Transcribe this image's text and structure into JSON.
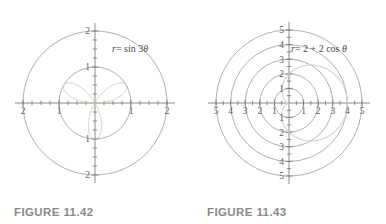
{
  "page": {
    "background_color": "#ffffff",
    "type": "textbook-polar-plot-pair"
  },
  "figures": [
    {
      "caption": "FIGURE 11.42",
      "equation_plain": "r = sin 3θ",
      "equation_parts": {
        "r": "r",
        "eq": "= sin 3",
        "theta": "θ"
      },
      "axis_max": 2,
      "x_labels_left": [
        "2",
        "1"
      ],
      "x_labels_right": [
        "1",
        "2"
      ],
      "y_labels_up": [
        "1",
        "2"
      ],
      "y_labels_down": [
        "1",
        "2"
      ],
      "grid_circle_radii": [
        1,
        2
      ],
      "curve_color": "#cfc6b4",
      "grid_color": "#8d8d8d"
    },
    {
      "caption": "FIGURE 11.43",
      "equation_plain": "r = 2 + 2 cos θ",
      "equation_parts": {
        "r": "r",
        "eq": "= 2 + 2 cos ",
        "theta": "θ"
      },
      "axis_max": 5,
      "x_labels_left": [
        "5",
        "4",
        "3",
        "2",
        "1"
      ],
      "x_labels_right": [
        "1",
        "2",
        "3",
        "4",
        "5"
      ],
      "y_labels_up": [
        "1",
        "2",
        "3",
        "4",
        "5"
      ],
      "y_labels_down": [
        "1",
        "2",
        "3",
        "4",
        "5"
      ],
      "grid_circle_radii": [
        1,
        2,
        3,
        4,
        5
      ],
      "curve_color": "#d6d2c8",
      "grid_color": "#8d8d8d"
    }
  ],
  "chart_data": [
    {
      "type": "line",
      "subtype": "polar",
      "title": "FIGURE 11.42",
      "equation": "r = sin 3θ",
      "xlabel": "",
      "ylabel": "",
      "xlim": [
        -2,
        2
      ],
      "ylim": [
        -2,
        2
      ],
      "grid": true,
      "grid_circles": [
        1,
        2
      ],
      "xticks": [
        -2,
        -1,
        1,
        2
      ],
      "yticks": [
        -2,
        -1,
        1,
        2
      ],
      "xtick_labels": [
        "2",
        "1",
        "1",
        "2"
      ],
      "ytick_labels": [
        "2",
        "1",
        "1",
        "2"
      ],
      "legend": null,
      "series": [
        {
          "name": "r = sin 3θ",
          "description": "three-petal rose, petal max radius 1, petals centered at θ = 30°, 150°, 270°",
          "petal_count": 3,
          "max_radius": 1,
          "petal_angles_deg": [
            30,
            150,
            270
          ],
          "color": "#cfc6b4"
        }
      ]
    },
    {
      "type": "line",
      "subtype": "polar",
      "title": "FIGURE 11.43",
      "equation": "r = 2 + 2 cos θ",
      "xlabel": "",
      "ylabel": "",
      "xlim": [
        -5,
        5
      ],
      "ylim": [
        -5,
        5
      ],
      "grid": true,
      "grid_circles": [
        1,
        2,
        3,
        4,
        5
      ],
      "xticks": [
        -5,
        -4,
        -3,
        -2,
        -1,
        1,
        2,
        3,
        4,
        5
      ],
      "yticks": [
        -5,
        -4,
        -3,
        -2,
        -1,
        1,
        2,
        3,
        4,
        5
      ],
      "xtick_labels": [
        "5",
        "4",
        "3",
        "2",
        "1",
        "1",
        "2",
        "3",
        "4",
        "5"
      ],
      "ytick_labels": [
        "5",
        "4",
        "3",
        "2",
        "1",
        "1",
        "2",
        "3",
        "4",
        "5"
      ],
      "legend": null,
      "series": [
        {
          "name": "r = 2 + 2 cos θ",
          "description": "cardioid, max radius 4 at θ = 0, cusp at origin at θ = 180°",
          "max_radius": 4,
          "cusp_angle_deg": 180,
          "color": "#d6d2c8"
        }
      ]
    }
  ]
}
